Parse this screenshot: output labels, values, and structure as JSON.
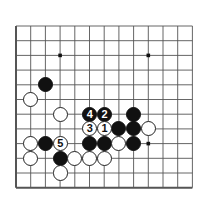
{
  "diagram": {
    "kind": "go-board-problem-diagram",
    "board": {
      "cols": 13,
      "rows": 12,
      "origin_x": 16,
      "origin_y": 26,
      "spacing": 14.7,
      "line_color": "#555555",
      "edge_color": "#444444",
      "background_color": "#ffffff",
      "stone_radius": 7.6
    },
    "star_points": [
      {
        "name": "star-point-left",
        "col": 3,
        "row": 2
      },
      {
        "name": "star-point-right",
        "col": 9,
        "row": 2
      },
      {
        "name": "star-point-lower-right",
        "col": 9,
        "row": 8
      }
    ],
    "colors": {
      "black_stone": "#111111",
      "white_stone": "#ffffff",
      "white_stone_outline": "#222222",
      "black_label_text": "#ffffff",
      "white_label_text": "#111111"
    },
    "stones": [
      {
        "name": "black-stone-upper-left",
        "color": "black",
        "col": 2,
        "row": 4,
        "label": ""
      },
      {
        "name": "white-stone-left-edge",
        "color": "white",
        "col": 1,
        "row": 5,
        "label": ""
      },
      {
        "name": "white-stone-left-inner",
        "color": "white",
        "col": 3,
        "row": 6,
        "label": ""
      },
      {
        "name": "black-stone-move-4",
        "color": "black",
        "col": 5,
        "row": 6,
        "label": "4"
      },
      {
        "name": "black-stone-move-2",
        "color": "black",
        "col": 6,
        "row": 6,
        "label": "2"
      },
      {
        "name": "black-stone-upper-right-group",
        "color": "black",
        "col": 8,
        "row": 6,
        "label": ""
      },
      {
        "name": "white-stone-move-3",
        "color": "white",
        "col": 5,
        "row": 7,
        "label": "3"
      },
      {
        "name": "white-stone-move-1",
        "color": "white",
        "col": 6,
        "row": 7,
        "label": "1"
      },
      {
        "name": "black-stone-row7-col7",
        "color": "black",
        "col": 7,
        "row": 7,
        "label": ""
      },
      {
        "name": "black-stone-row7-col8",
        "color": "black",
        "col": 8,
        "row": 7,
        "label": ""
      },
      {
        "name": "white-stone-row7-col9",
        "color": "white",
        "col": 9,
        "row": 7,
        "label": ""
      },
      {
        "name": "white-stone-row8-col1",
        "color": "white",
        "col": 1,
        "row": 8,
        "label": ""
      },
      {
        "name": "black-stone-row8-col2",
        "color": "black",
        "col": 2,
        "row": 8,
        "label": ""
      },
      {
        "name": "white-stone-move-5",
        "color": "white",
        "col": 3,
        "row": 8,
        "label": "5"
      },
      {
        "name": "black-stone-row8-col5",
        "color": "black",
        "col": 5,
        "row": 8,
        "label": ""
      },
      {
        "name": "black-stone-row8-col6",
        "color": "black",
        "col": 6,
        "row": 8,
        "label": ""
      },
      {
        "name": "white-stone-row8-col7",
        "color": "white",
        "col": 7,
        "row": 8,
        "label": ""
      },
      {
        "name": "black-stone-row8-col8",
        "color": "black",
        "col": 8,
        "row": 8,
        "label": ""
      },
      {
        "name": "white-stone-row9-col1",
        "color": "white",
        "col": 1,
        "row": 9,
        "label": ""
      },
      {
        "name": "black-stone-row9-col3",
        "color": "black",
        "col": 3,
        "row": 9,
        "label": ""
      },
      {
        "name": "white-stone-row9-col4",
        "color": "white",
        "col": 4,
        "row": 9,
        "label": ""
      },
      {
        "name": "white-stone-row9-col5",
        "color": "white",
        "col": 5,
        "row": 9,
        "label": ""
      },
      {
        "name": "white-stone-row9-col6",
        "color": "white",
        "col": 6,
        "row": 9,
        "label": ""
      },
      {
        "name": "white-stone-row10-col3",
        "color": "white",
        "col": 3,
        "row": 10,
        "label": ""
      }
    ]
  }
}
